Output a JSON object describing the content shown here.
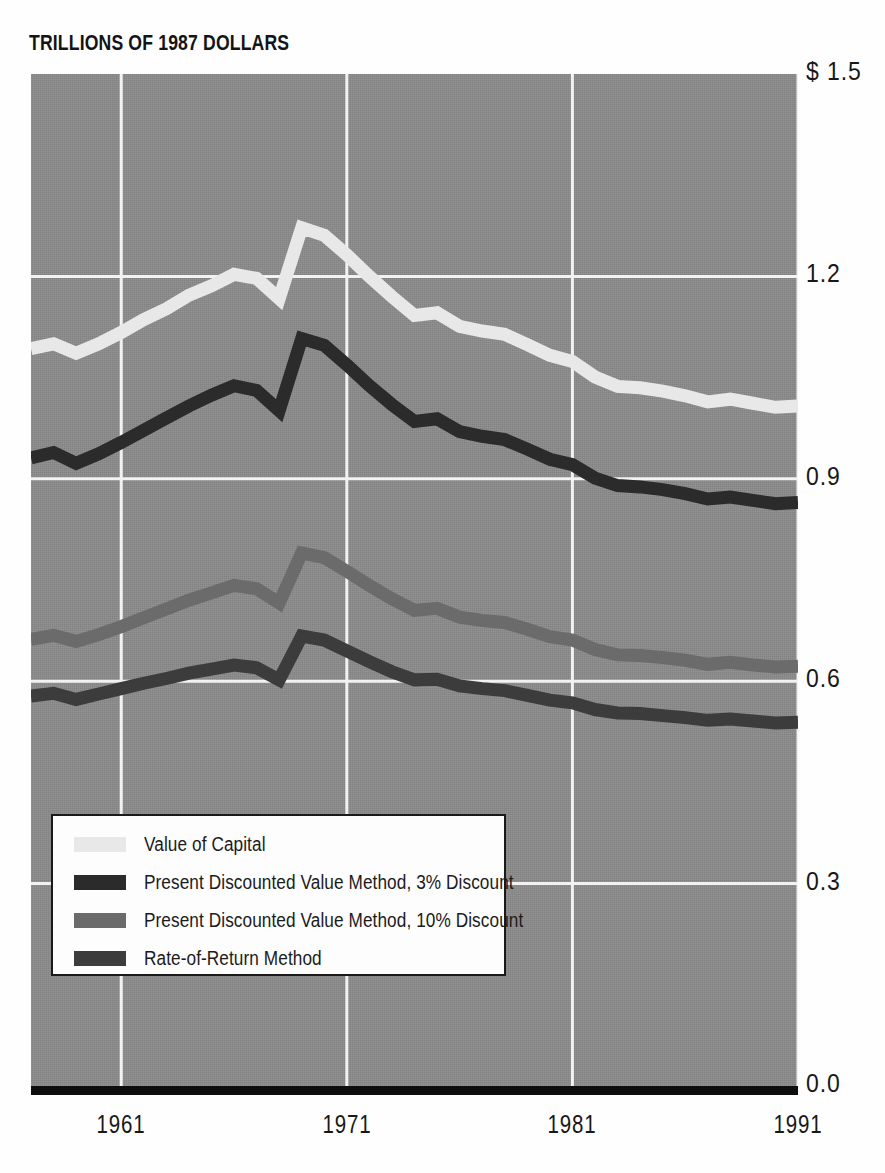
{
  "title": "TRILLIONS OF 1987 DOLLARS",
  "axes": {
    "y_ticks": [
      "$ 1.5",
      "1.2",
      "0.9",
      "0.6",
      "0.3",
      "0.0"
    ],
    "x_ticks": [
      "1961",
      "1971",
      "1981",
      "1991"
    ]
  },
  "legend": {
    "items": [
      {
        "label": "Value of Capital",
        "color": "#e8e8e8"
      },
      {
        "label": "Present Discounted Value Method, 3% Discount",
        "color": "#2b2b2b"
      },
      {
        "label": "Present Discounted Value Method, 10% Discount",
        "color": "#6b6b6b"
      },
      {
        "label": "Rate-of-Return Method",
        "color": "#3c3c3c"
      }
    ]
  },
  "colors": {
    "plot_background": "#8b8b8b",
    "gridline": "#f2f2f2",
    "baseline": "#0d0d0d",
    "text": "#181818"
  },
  "chart_data": {
    "type": "line",
    "title": "TRILLIONS OF 1987 DOLLARS",
    "xlabel": "",
    "ylabel": "Trillions of 1987 Dollars",
    "xlim": [
      1957,
      1991
    ],
    "ylim": [
      0.0,
      1.5
    ],
    "ytick_values": [
      1.5,
      1.2,
      0.9,
      0.6,
      0.3,
      0.0
    ],
    "xtick_values": [
      1961,
      1971,
      1981,
      1991
    ],
    "grid": true,
    "legend_position": "lower-left",
    "x": [
      1957,
      1958,
      1959,
      1960,
      1961,
      1962,
      1963,
      1964,
      1965,
      1966,
      1967,
      1968,
      1969,
      1970,
      1971,
      1972,
      1973,
      1974,
      1975,
      1976,
      1977,
      1978,
      1979,
      1980,
      1981,
      1982,
      1983,
      1984,
      1985,
      1986,
      1987,
      1988,
      1989,
      1990,
      1991
    ],
    "series": [
      {
        "name": "Value of Capital",
        "color": "#e8e8e8",
        "values": [
          1.093,
          1.1,
          1.086,
          1.1,
          1.117,
          1.136,
          1.152,
          1.172,
          1.186,
          1.203,
          1.197,
          1.167,
          1.272,
          1.261,
          1.232,
          1.2,
          1.17,
          1.142,
          1.146,
          1.126,
          1.119,
          1.114,
          1.099,
          1.083,
          1.074,
          1.051,
          1.037,
          1.035,
          1.03,
          1.023,
          1.014,
          1.018,
          1.012,
          1.006,
          1.008
        ]
      },
      {
        "name": "Present Discounted Value Method, 3% Discount",
        "color": "#2b2b2b",
        "values": [
          0.931,
          0.939,
          0.923,
          0.937,
          0.954,
          0.972,
          0.99,
          1.008,
          1.024,
          1.038,
          1.031,
          1.001,
          1.108,
          1.098,
          1.069,
          1.038,
          1.01,
          0.985,
          0.989,
          0.97,
          0.963,
          0.958,
          0.944,
          0.929,
          0.921,
          0.901,
          0.89,
          0.888,
          0.884,
          0.878,
          0.87,
          0.873,
          0.868,
          0.863,
          0.865
        ]
      },
      {
        "name": "Present Discounted Value Method, 10% Discount",
        "color": "#6b6b6b",
        "values": [
          0.662,
          0.668,
          0.659,
          0.669,
          0.681,
          0.694,
          0.707,
          0.72,
          0.731,
          0.742,
          0.737,
          0.716,
          0.79,
          0.783,
          0.763,
          0.742,
          0.722,
          0.705,
          0.708,
          0.695,
          0.69,
          0.687,
          0.677,
          0.666,
          0.661,
          0.647,
          0.639,
          0.638,
          0.635,
          0.631,
          0.625,
          0.628,
          0.624,
          0.621,
          0.622
        ]
      },
      {
        "name": "Rate-of-Return Method",
        "color": "#3c3c3c",
        "values": [
          0.578,
          0.582,
          0.573,
          0.581,
          0.589,
          0.597,
          0.604,
          0.612,
          0.618,
          0.624,
          0.62,
          0.602,
          0.667,
          0.661,
          0.645,
          0.629,
          0.614,
          0.602,
          0.603,
          0.593,
          0.589,
          0.586,
          0.579,
          0.572,
          0.568,
          0.558,
          0.553,
          0.552,
          0.549,
          0.546,
          0.542,
          0.544,
          0.541,
          0.538,
          0.539
        ]
      }
    ]
  }
}
